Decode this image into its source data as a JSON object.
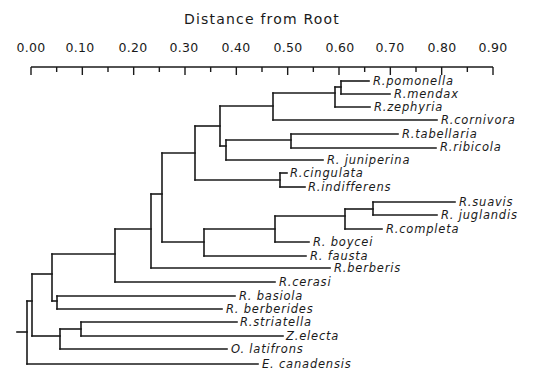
{
  "chart_data": {
    "type": "dendrogram",
    "title": "Distance from Root",
    "axis": {
      "position": "top",
      "ticks": [
        "0.00",
        "0.10",
        "0.20",
        "0.30",
        "0.40",
        "0.50",
        "0.60",
        "0.70",
        "0.80",
        "0.90"
      ],
      "range": [
        0.0,
        0.9
      ],
      "minor_tick_step": 0.05
    },
    "leaves": [
      {
        "name": "R. pomonella",
        "distance": 0.62
      },
      {
        "name": "R. mendax",
        "distance": 0.65
      },
      {
        "name": "R. zephyria",
        "distance": 0.62
      },
      {
        "name": "R. cornivora",
        "distance": 0.71
      },
      {
        "name": "R. tabellaria",
        "distance": 0.64
      },
      {
        "name": "R. ribicola",
        "distance": 0.68
      },
      {
        "name": "R. juniperina",
        "distance": 0.53
      },
      {
        "name": "R. cingulata",
        "distance": 0.44
      },
      {
        "name": "R. indifferens",
        "distance": 0.5
      },
      {
        "name": "R. suavis",
        "distance": 0.8
      },
      {
        "name": "R. juglandis",
        "distance": 0.78
      },
      {
        "name": "R. completa",
        "distance": 0.72
      },
      {
        "name": "R. boycei",
        "distance": 0.59
      },
      {
        "name": "R. fausta",
        "distance": 0.58
      },
      {
        "name": "R. berberis",
        "distance": 0.61
      },
      {
        "name": "R. cerasi",
        "distance": 0.53
      },
      {
        "name": "R. basiola",
        "distance": 0.45
      },
      {
        "name": "R. berberides",
        "distance": 0.43
      },
      {
        "name": "R. striatella",
        "distance": 0.45
      },
      {
        "name": "Z. electa",
        "distance": 0.53
      },
      {
        "name": "O. latifrons",
        "distance": 0.44
      },
      {
        "name": "E. canadensis",
        "distance": 0.48
      }
    ],
    "grid": false,
    "legend": "none"
  },
  "labels": {
    "title": "Distance from Root",
    "ticks": [
      "0.00",
      "0.10",
      "0.20",
      "0.30",
      "0.40",
      "0.50",
      "0.60",
      "0.70",
      "0.80",
      "0.90"
    ],
    "leaves": [
      "R.pomonella",
      "R.mendax",
      "R.zephyria",
      "R.cornivora",
      "R.tabellaria",
      "R.ribicola",
      "R. juniperina",
      "R.cingulata",
      "R.indifferens",
      "R.suavis",
      "R. juglandis",
      "R.completa",
      "R. boycei",
      "R. fausta",
      "R.berberis",
      "R.cerasi",
      "R. basiola",
      "R. berberides",
      "R.striatella",
      "Z.electa",
      "O. latifrons",
      "E. canadensis"
    ]
  }
}
